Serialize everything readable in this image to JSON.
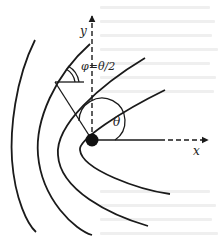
{
  "figure": {
    "labels": {
      "y_axis": "y",
      "x_axis": "x",
      "theta": "θ",
      "phi_relation": "φ=θ/2"
    },
    "colors": {
      "stroke": "#1a1a1a",
      "background": "#ffffff"
    },
    "elements": {
      "focus": "filled circle at origin",
      "curves": "nested confocal parabolas opening to the right",
      "axes": "dashed x and y axes with arrowheads"
    }
  }
}
